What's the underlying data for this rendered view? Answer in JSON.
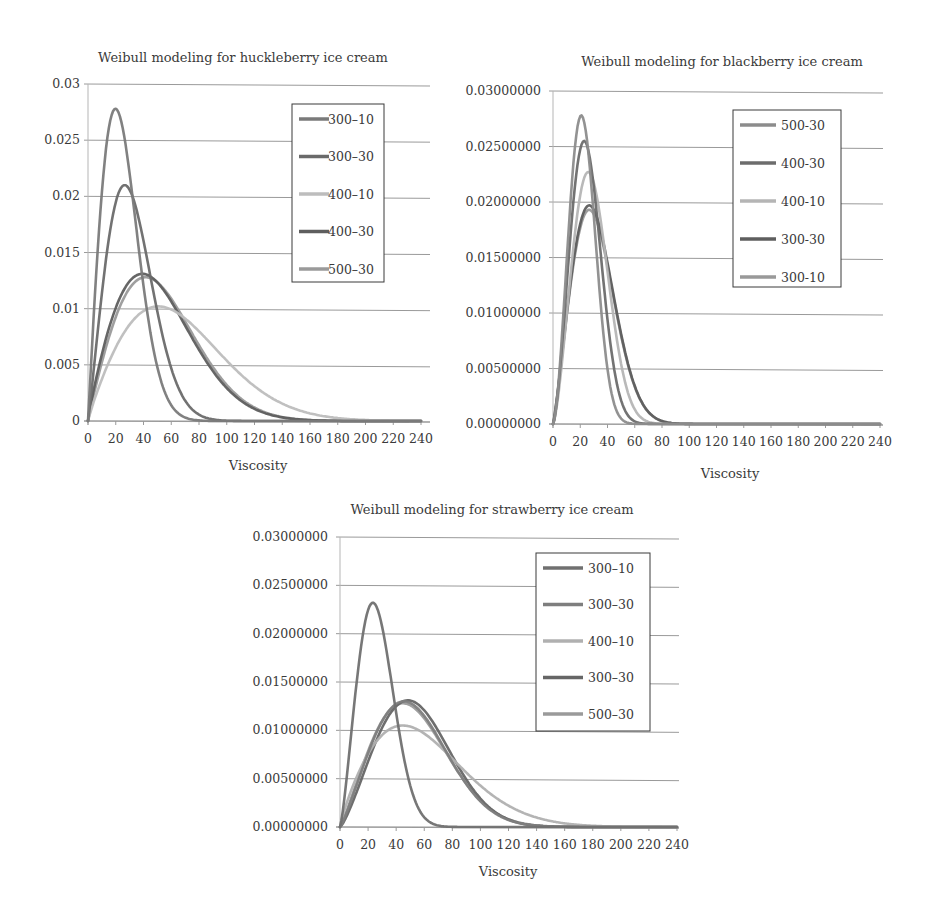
{
  "chart_data": [
    {
      "type": "line",
      "title": "Weibull modeling for huckleberry ice cream",
      "xlabel": "Viscosity",
      "ylabel": "",
      "xlim": [
        0,
        240
      ],
      "ylim": [
        0,
        0.03
      ],
      "x_ticks": [
        "0",
        "20",
        "40",
        "60",
        "80",
        "100",
        "120",
        "140",
        "160",
        "180",
        "200",
        "220",
        "240"
      ],
      "y_ticks": [
        "0",
        "0.005",
        "0.01",
        "0.015",
        "0.02",
        "0.025",
        "0.03"
      ],
      "grid": "horizontal",
      "legend_position": "upper right (inside)",
      "series": [
        {
          "name": "300–10",
          "color": "#7a7a7a",
          "peak_x": 20,
          "peak_y": 0.0278,
          "approx_shape": 2.0,
          "approx_scale": 28,
          "tail_end_x": 100
        },
        {
          "name": "300–30",
          "color": "#6a6a6a",
          "peak_x": 25,
          "peak_y": 0.021,
          "approx_shape": 2.1,
          "approx_scale": 36,
          "tail_end_x": 130
        },
        {
          "name": "400–10",
          "color": "#bdbdbd",
          "peak_x": 45,
          "peak_y": 0.0102,
          "approx_shape": 1.9,
          "approx_scale": 75,
          "tail_end_x": 220
        },
        {
          "name": "400–30",
          "color": "#5e5e5e",
          "peak_x": 38,
          "peak_y": 0.0131,
          "approx_shape": 1.9,
          "approx_scale": 58,
          "tail_end_x": 180
        },
        {
          "name": "500–30",
          "color": "#9a9a9a",
          "peak_x": 42,
          "peak_y": 0.0128,
          "approx_shape": 1.95,
          "approx_scale": 60,
          "tail_end_x": 180
        }
      ]
    },
    {
      "type": "line",
      "title": "Weibull modeling for blackberry ice cream",
      "xlabel": "Viscosity",
      "ylabel": "",
      "xlim": [
        0,
        240
      ],
      "ylim": [
        0,
        0.03
      ],
      "x_ticks": [
        "0",
        "20",
        "40",
        "60",
        "80",
        "100",
        "120",
        "140",
        "160",
        "180",
        "200",
        "220",
        "240"
      ],
      "y_ticks": [
        "0.00000000",
        "0.00500000",
        "0.01000000",
        "0.01500000",
        "0.02000000",
        "0.02500000",
        "0.03000000"
      ],
      "grid": "horizontal",
      "legend_position": "upper right (inside)",
      "series": [
        {
          "name": "500-30",
          "color": "#8c8c8c",
          "peak_x": 19,
          "peak_y": 0.0278,
          "approx_shape": 2.6,
          "approx_scale": 25,
          "tail_end_x": 90
        },
        {
          "name": "400-30",
          "color": "#6c6c6c",
          "peak_x": 22,
          "peak_y": 0.0255,
          "approx_shape": 2.5,
          "approx_scale": 28,
          "tail_end_x": 100
        },
        {
          "name": "400-10",
          "color": "#b5b5b5",
          "peak_x": 25,
          "peak_y": 0.0227,
          "approx_shape": 2.45,
          "approx_scale": 32,
          "tail_end_x": 110
        },
        {
          "name": "300-30",
          "color": "#5e5e5e",
          "peak_x": 25,
          "peak_y": 0.0197,
          "approx_shape": 2.2,
          "approx_scale": 35,
          "tail_end_x": 130
        },
        {
          "name": "300-10",
          "color": "#999999",
          "peak_x": 25,
          "peak_y": 0.0193,
          "approx_shape": 2.2,
          "approx_scale": 35,
          "tail_end_x": 130
        }
      ]
    },
    {
      "type": "line",
      "title": "Weibull modeling for strawberry ice cream",
      "xlabel": "Viscosity",
      "ylabel": "",
      "xlim": [
        0,
        240
      ],
      "ylim": [
        0,
        0.03
      ],
      "x_ticks": [
        "0",
        "20",
        "40",
        "60",
        "80",
        "100",
        "120",
        "140",
        "160",
        "180",
        "200",
        "220",
        "240"
      ],
      "y_ticks": [
        "0.00000000",
        "0.00500000",
        "0.01000000",
        "0.01500000",
        "0.02000000",
        "0.02500000",
        "0.03000000"
      ],
      "grid": "horizontal",
      "legend_position": "upper right (inside)",
      "series": [
        {
          "name": "300–10",
          "color": "#707070",
          "peak_x": 22,
          "peak_y": 0.0232,
          "approx_shape": 2.3,
          "approx_scale": 30,
          "tail_end_x": 100
        },
        {
          "name": "300–30",
          "color": "#7e7e7e",
          "peak_x": 45,
          "peak_y": 0.013,
          "approx_shape": 2.2,
          "approx_scale": 60,
          "tail_end_x": 170
        },
        {
          "name": "400–10",
          "color": "#b0b0b0",
          "peak_x": 42,
          "peak_y": 0.0105,
          "approx_shape": 1.85,
          "approx_scale": 68,
          "tail_end_x": 220
        },
        {
          "name": "300–30",
          "color": "#666666",
          "peak_x": 47,
          "peak_y": 0.0131,
          "approx_shape": 2.3,
          "approx_scale": 62,
          "tail_end_x": 170
        },
        {
          "name": "500–30",
          "color": "#9a9a9a",
          "peak_x": 43,
          "peak_y": 0.0128,
          "approx_shape": 2.15,
          "approx_scale": 60,
          "tail_end_x": 175
        }
      ]
    }
  ]
}
